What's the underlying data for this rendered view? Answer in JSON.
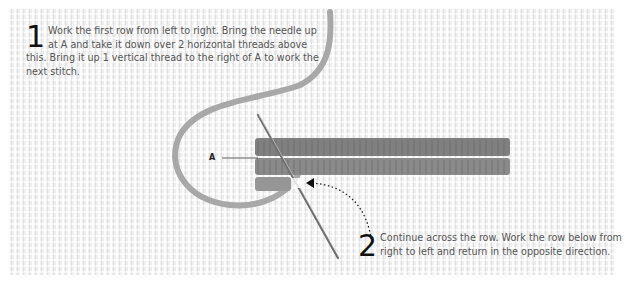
{
  "illustration": {
    "subject": "cross-stitch / long-stitch rows on canvas with threaded needle",
    "label_a": "A",
    "colors": {
      "canvas": "#eeeeee",
      "yarn": "#9a9a9a",
      "stitches": "#7d7d7d",
      "needle": "#777777",
      "text": "#555555",
      "step_number": "#111111"
    }
  },
  "steps": [
    {
      "number": "1",
      "text": "Work the first row from left to right. Bring the needle up at A and take it down over 2 horizontal threads above this. Bring it up 1 vertical thread to the right of A to work the next stitch."
    },
    {
      "number": "2",
      "text": "Continue across the row. Work the row below from right to left and return in the opposite direction."
    }
  ]
}
